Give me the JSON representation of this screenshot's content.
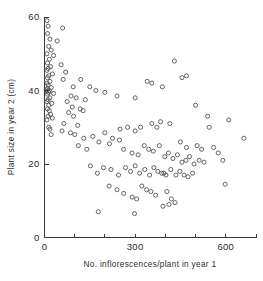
{
  "chart_data": {
    "type": "scatter",
    "title": "",
    "xlabel": "No. inflorescences/plant in year 1",
    "ylabel": "Plant size in year 2 (cm)",
    "xlim": [
      0,
      700
    ],
    "ylim": [
      0,
      60
    ],
    "grid": false,
    "legend": null,
    "marker": "open-circle",
    "x_major_ticks": [
      0,
      300,
      600
    ],
    "x_major_tick_labels": [
      "0",
      "300",
      "600"
    ],
    "x_minor_ticks": [
      100,
      200,
      400,
      500,
      700
    ],
    "y_major_ticks": [
      0,
      20,
      40,
      60
    ],
    "y_major_tick_labels": [
      "0",
      "20",
      "40",
      "60"
    ],
    "points": [
      [
        8,
        59
      ],
      [
        12,
        57.5
      ],
      [
        60,
        57
      ],
      [
        10,
        55.5
      ],
      [
        18,
        54
      ],
      [
        42,
        53.5
      ],
      [
        14,
        52
      ],
      [
        22,
        51
      ],
      [
        8,
        50
      ],
      [
        30,
        49.5
      ],
      [
        16,
        48.5
      ],
      [
        10,
        47.5
      ],
      [
        55,
        47
      ],
      [
        20,
        46.5
      ],
      [
        12,
        46
      ],
      [
        8,
        45.5
      ],
      [
        70,
        45
      ],
      [
        26,
        44.5
      ],
      [
        14,
        44
      ],
      [
        10,
        43.5
      ],
      [
        62,
        43
      ],
      [
        18,
        42.5
      ],
      [
        8,
        42
      ],
      [
        12,
        41.5
      ],
      [
        95,
        41
      ],
      [
        22,
        40.8
      ],
      [
        10,
        40.5
      ],
      [
        6,
        40.2
      ],
      [
        16,
        40
      ],
      [
        8,
        39.8
      ],
      [
        14,
        39.5
      ],
      [
        30,
        39.2
      ],
      [
        10,
        39
      ],
      [
        120,
        43
      ],
      [
        150,
        41
      ],
      [
        88,
        38.5
      ],
      [
        18,
        38
      ],
      [
        12,
        37.5
      ],
      [
        8,
        37
      ],
      [
        170,
        40
      ],
      [
        105,
        38
      ],
      [
        75,
        37
      ],
      [
        24,
        36.5
      ],
      [
        14,
        36
      ],
      [
        200,
        39.5
      ],
      [
        135,
        37.5
      ],
      [
        92,
        35.5
      ],
      [
        10,
        35
      ],
      [
        16,
        34.5
      ],
      [
        240,
        38.5
      ],
      [
        118,
        35
      ],
      [
        80,
        34
      ],
      [
        20,
        33.5
      ],
      [
        12,
        33
      ],
      [
        300,
        38
      ],
      [
        128,
        34.5
      ],
      [
        96,
        33
      ],
      [
        26,
        32.5
      ],
      [
        8,
        32
      ],
      [
        355,
        42
      ],
      [
        390,
        41
      ],
      [
        430,
        48
      ],
      [
        455,
        43.5
      ],
      [
        470,
        44
      ],
      [
        64,
        31
      ],
      [
        110,
        30.5
      ],
      [
        14,
        30
      ],
      [
        18,
        29.5
      ],
      [
        340,
        42.5
      ],
      [
        500,
        36
      ],
      [
        540,
        33
      ],
      [
        610,
        32
      ],
      [
        355,
        31
      ],
      [
        372,
        30
      ],
      [
        384,
        31.5
      ],
      [
        415,
        31
      ],
      [
        58,
        29
      ],
      [
        86,
        28.5
      ],
      [
        100,
        28
      ],
      [
        22,
        28
      ],
      [
        130,
        27
      ],
      [
        160,
        27.5
      ],
      [
        200,
        28.5
      ],
      [
        225,
        27
      ],
      [
        250,
        29.5
      ],
      [
        275,
        30
      ],
      [
        300,
        29
      ],
      [
        318,
        30
      ],
      [
        545,
        30
      ],
      [
        660,
        27
      ],
      [
        450,
        26
      ],
      [
        470,
        24.5
      ],
      [
        505,
        25
      ],
      [
        520,
        24
      ],
      [
        560,
        24.5
      ],
      [
        575,
        23
      ],
      [
        112,
        25
      ],
      [
        140,
        24
      ],
      [
        180,
        26
      ],
      [
        215,
        25.5
      ],
      [
        248,
        26.5
      ],
      [
        262,
        24
      ],
      [
        290,
        23
      ],
      [
        310,
        22.5
      ],
      [
        330,
        25
      ],
      [
        345,
        24
      ],
      [
        360,
        23.5
      ],
      [
        380,
        25
      ],
      [
        398,
        22
      ],
      [
        410,
        23
      ],
      [
        425,
        21.5
      ],
      [
        440,
        22.5
      ],
      [
        455,
        20.5
      ],
      [
        468,
        21
      ],
      [
        480,
        22
      ],
      [
        495,
        20
      ],
      [
        512,
        21
      ],
      [
        528,
        20.5
      ],
      [
        590,
        21
      ],
      [
        152,
        19.5
      ],
      [
        175,
        17.5
      ],
      [
        195,
        19
      ],
      [
        220,
        18.5
      ],
      [
        245,
        17
      ],
      [
        268,
        19
      ],
      [
        285,
        18
      ],
      [
        300,
        19.5
      ],
      [
        315,
        17.5
      ],
      [
        332,
        18.5
      ],
      [
        348,
        17
      ],
      [
        362,
        19
      ],
      [
        375,
        18
      ],
      [
        388,
        17.5
      ],
      [
        395,
        17.5
      ],
      [
        402,
        17
      ],
      [
        418,
        18.5
      ],
      [
        435,
        17
      ],
      [
        448,
        18
      ],
      [
        462,
        17
      ],
      [
        475,
        16.5
      ],
      [
        490,
        17.5
      ],
      [
        214,
        14
      ],
      [
        240,
        13
      ],
      [
        262,
        12
      ],
      [
        290,
        11
      ],
      [
        305,
        10.5
      ],
      [
        322,
        14
      ],
      [
        338,
        13
      ],
      [
        352,
        12.5
      ],
      [
        368,
        11.5
      ],
      [
        405,
        12.5
      ],
      [
        420,
        10.5
      ],
      [
        432,
        9.5
      ],
      [
        598,
        14.5
      ],
      [
        178,
        7
      ],
      [
        298,
        6.5
      ],
      [
        392,
        8.5
      ],
      [
        412,
        9
      ]
    ]
  },
  "axis_color": "#3a3a3a",
  "marker_color": "#4a4a4a"
}
